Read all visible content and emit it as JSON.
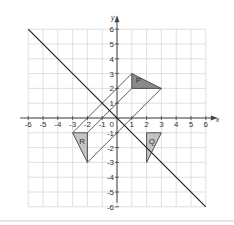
{
  "diagram": {
    "axes": {
      "x_label": "x",
      "y_label": "y",
      "x_range": [
        -6,
        6
      ],
      "y_range": [
        -6,
        6
      ],
      "x_ticks": [
        "-6",
        "-5",
        "-4",
        "-3",
        "-2",
        "-1",
        "1",
        "2",
        "3",
        "4",
        "5",
        "6"
      ],
      "y_ticks": [
        "6",
        "5",
        "4",
        "3",
        "2",
        "1",
        "-1",
        "-2",
        "-3",
        "-4",
        "-5",
        "-6"
      ],
      "origin_label": "0"
    },
    "mirror_line": {
      "equation": "y = -x",
      "from": [
        -6,
        6
      ],
      "to": [
        6,
        -6
      ]
    },
    "shapes": [
      {
        "label": "P",
        "vertices": [
          [
            1,
            3
          ],
          [
            1,
            2
          ],
          [
            3,
            2
          ]
        ],
        "fill": "#8a8a8a"
      },
      {
        "label": "R",
        "vertices": [
          [
            -3,
            -1
          ],
          [
            -2,
            -1
          ],
          [
            -2,
            -3
          ]
        ],
        "fill": "#c4c4c4"
      },
      {
        "label": "Q",
        "vertices": [
          [
            2,
            -1
          ],
          [
            3,
            -1
          ],
          [
            2,
            -3
          ]
        ],
        "fill": "#c4c4c4"
      }
    ],
    "construction_lines": [
      {
        "from": [
          1,
          3
        ],
        "to": [
          -3,
          -1
        ]
      },
      {
        "from": [
          1,
          2
        ],
        "to": [
          -2,
          -1
        ]
      },
      {
        "from": [
          3,
          2
        ],
        "to": [
          -2,
          -3
        ]
      }
    ],
    "colors": {
      "grid": "#d8d8d8",
      "axis": "#444444",
      "line": "#333333"
    }
  }
}
